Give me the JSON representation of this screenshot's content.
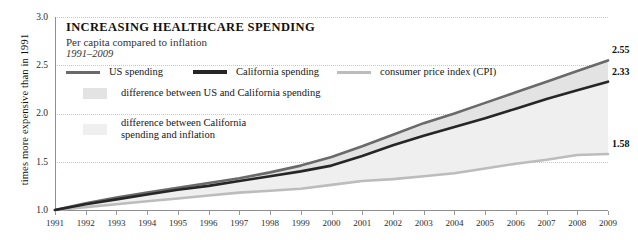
{
  "title": {
    "main": "INCREASING HEALTHCARE SPENDING",
    "subtitle": "Per capita compared to inflation",
    "period": "1991–2009"
  },
  "axes": {
    "ylabel": "times more expensive than in 1991",
    "yticks": [
      "1.0",
      "1.5",
      "2.0",
      "2.5",
      "3.0"
    ],
    "xticks": [
      "1991",
      "1992",
      "1993",
      "1994",
      "1995",
      "1996",
      "1997",
      "1998",
      "1999",
      "2000",
      "2001",
      "2002",
      "2003",
      "2004",
      "2005",
      "2006",
      "2007",
      "2008",
      "2009"
    ]
  },
  "legend": {
    "us": "US spending",
    "ca": "California spending",
    "cpi": "consumer price index (CPI)",
    "band_us_ca": "difference between US and California spending",
    "band_ca_cpi_line1": "difference between California",
    "band_ca_cpi_line2": "spending and inflation"
  },
  "endlabels": {
    "us": "2.55",
    "ca": "2.33",
    "cpi": "1.58"
  },
  "colors": {
    "us_line": "#6a6a6a",
    "ca_line": "#262626",
    "cpi_line": "#bcbcbc",
    "band_us_ca": "#e3e3e3",
    "band_ca_cpi": "#efefef",
    "grid": "#c9c9c9",
    "axis": "#8f8f8f",
    "text": "#1a1a1a"
  },
  "chart_data": {
    "type": "line",
    "title": "INCREASING HEALTHCARE SPENDING",
    "subtitle": "Per capita compared to inflation, 1991–2009",
    "xlabel": "",
    "ylabel": "times more expensive than in 1991",
    "x": [
      1991,
      1992,
      1993,
      1994,
      1995,
      1996,
      1997,
      1998,
      1999,
      2000,
      2001,
      2002,
      2003,
      2004,
      2005,
      2006,
      2007,
      2008,
      2009
    ],
    "xlim": [
      1991,
      2009
    ],
    "ylim": [
      1.0,
      3.0
    ],
    "yticks": [
      1.0,
      1.5,
      2.0,
      2.5,
      3.0
    ],
    "grid": true,
    "legend_position": "top-inside",
    "series": [
      {
        "name": "US spending",
        "color": "#6a6a6a",
        "values": [
          1.0,
          1.07,
          1.13,
          1.18,
          1.23,
          1.28,
          1.33,
          1.39,
          1.46,
          1.55,
          1.66,
          1.78,
          1.9,
          2.0,
          2.11,
          2.22,
          2.33,
          2.44,
          2.55
        ],
        "end_label": "2.55"
      },
      {
        "name": "California spending",
        "color": "#262626",
        "values": [
          1.0,
          1.06,
          1.11,
          1.16,
          1.21,
          1.25,
          1.3,
          1.35,
          1.4,
          1.46,
          1.56,
          1.67,
          1.77,
          1.86,
          1.95,
          2.05,
          2.15,
          2.24,
          2.33
        ],
        "end_label": "2.33"
      },
      {
        "name": "consumer price index (CPI)",
        "color": "#bcbcbc",
        "values": [
          1.0,
          1.03,
          1.06,
          1.09,
          1.12,
          1.15,
          1.18,
          1.2,
          1.22,
          1.26,
          1.3,
          1.32,
          1.35,
          1.38,
          1.43,
          1.48,
          1.52,
          1.57,
          1.58
        ],
        "end_label": "1.58"
      }
    ],
    "bands": [
      {
        "name": "difference between US and California spending",
        "between": [
          "US spending",
          "California spending"
        ],
        "fill": "#e3e3e3"
      },
      {
        "name": "difference between California spending and inflation",
        "between": [
          "California spending",
          "consumer price index (CPI)"
        ],
        "fill": "#efefef"
      }
    ]
  }
}
